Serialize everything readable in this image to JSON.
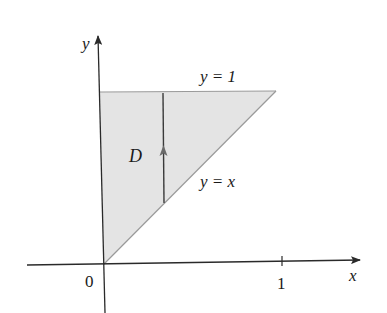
{
  "figure": {
    "region_label": "D",
    "axes": {
      "x_label": "x",
      "y_label": "y",
      "origin_label": "0",
      "x_tick_labels": [
        "1"
      ]
    },
    "curves": {
      "top": {
        "label": "y = 1"
      },
      "diagonal": {
        "label": "y = x"
      }
    },
    "colors": {
      "region_fill": "#e4e4e4",
      "axis": "#2a2a2a",
      "boundary": "#8a8a8a",
      "vertical_strip": "#3a3a3a",
      "strip_arrow": "#6a6a6a"
    }
  }
}
